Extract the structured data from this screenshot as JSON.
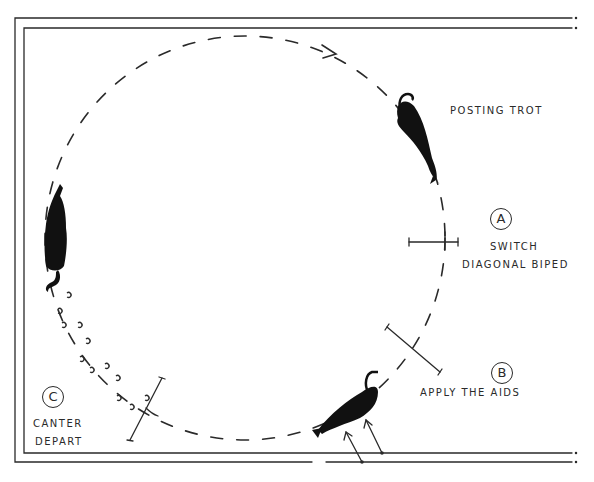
{
  "diagram": {
    "type": "riding-arena-figure",
    "ink_color": "#2a2a2a",
    "background": "#ffffff",
    "labels": {
      "posting_trot": "POSTING TROT",
      "point_a": "A",
      "switch": "SWITCH",
      "diagonal_biped": "DIAGONAL BIPED",
      "point_b": "B",
      "apply_aids": "APPLY THE AIDS",
      "point_c": "C",
      "canter": "CANTER",
      "depart": "DEPART"
    },
    "elements": [
      {
        "name": "arena-border",
        "shape": "double-line open rectangle"
      },
      {
        "name": "circle-path",
        "shape": "dashed circle with arrow (clockwise)"
      },
      {
        "name": "horse-posting-trot",
        "position": "upper right of circle"
      },
      {
        "name": "horse-left",
        "position": "left side of circle"
      },
      {
        "name": "horse-bottom",
        "position": "bottom of circle, with two arrows (aids)"
      },
      {
        "name": "hoofprints",
        "position": "trail from left horse toward C marker"
      },
      {
        "name": "marker-a",
        "shape": "cross tick on circle"
      },
      {
        "name": "marker-b",
        "shape": "diagonal tick on circle"
      },
      {
        "name": "marker-c",
        "shape": "diagonal tick on circle"
      }
    ]
  }
}
